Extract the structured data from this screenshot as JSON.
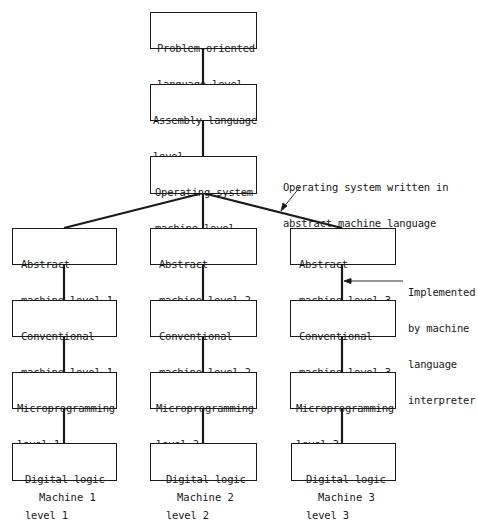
{
  "diagram": {
    "top_chain": [
      {
        "id": "problem-oriented",
        "lines": [
          "Problem-oriented",
          "language level"
        ]
      },
      {
        "id": "assembly",
        "lines": [
          "Assembly language",
          "level"
        ]
      },
      {
        "id": "operating-system",
        "lines": [
          "Operating system",
          "machine level"
        ]
      }
    ],
    "machines": [
      {
        "label": "Machine 1",
        "levels": [
          {
            "id": "abstract-1",
            "lines": [
              "Abstract",
              "machine level 1"
            ]
          },
          {
            "id": "conventional-1",
            "lines": [
              "Conventional",
              "machine level 1"
            ]
          },
          {
            "id": "microprogramming-1",
            "lines": [
              "Microprogramming",
              "level 1"
            ]
          },
          {
            "id": "digital-logic-1",
            "lines": [
              "Digital logic",
              "level 1"
            ]
          }
        ]
      },
      {
        "label": "Machine 2",
        "levels": [
          {
            "id": "abstract-2",
            "lines": [
              "Abstract",
              "machine level 2"
            ]
          },
          {
            "id": "conventional-2",
            "lines": [
              "Conventional",
              "machine level 2"
            ]
          },
          {
            "id": "microprogramming-2",
            "lines": [
              "Microprogramming",
              "level 2"
            ]
          },
          {
            "id": "digital-logic-2",
            "lines": [
              "Digital logic",
              "level 2"
            ]
          }
        ]
      },
      {
        "label": "Machine 3",
        "levels": [
          {
            "id": "abstract-3",
            "lines": [
              "Abstract",
              "machine level 3"
            ]
          },
          {
            "id": "conventional-3",
            "lines": [
              "Conventional",
              "machine level 3"
            ]
          },
          {
            "id": "microprogramming-3",
            "lines": [
              "Microprogramming",
              "level 3"
            ]
          },
          {
            "id": "digital-logic-3",
            "lines": [
              "Digital logic",
              "level 3"
            ]
          }
        ]
      }
    ],
    "annotations": {
      "os_written": [
        "Operating system written in",
        "abstract machine language"
      ],
      "implemented_by": [
        "Implemented",
        "by machine",
        "language",
        "interpreter"
      ]
    }
  },
  "colors": {
    "line": "#1a1a1a",
    "background": "#ffffff"
  }
}
